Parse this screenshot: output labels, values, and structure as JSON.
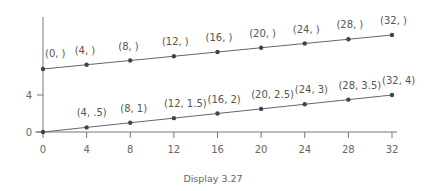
{
  "caption": "Display 3.27",
  "chart_data": {
    "type": "line",
    "title": "",
    "caption": "Display 3.27",
    "xlabel": "",
    "ylabel": "",
    "x_ticks": [
      0,
      4,
      8,
      12,
      16,
      20,
      24,
      28,
      32
    ],
    "y_ticks": [
      0,
      4
    ],
    "xlim": [
      0,
      32
    ],
    "grid": false,
    "legend": null,
    "series": [
      {
        "name": "upper line (y-values blank)",
        "x": [
          0,
          4,
          8,
          12,
          16,
          20,
          24,
          28,
          32
        ],
        "point_labels": [
          "(0, )",
          "(4, )",
          "(8, )",
          "(12, )",
          "(16, )",
          "(20, )",
          "(24, )",
          "(28, )",
          "(32, )"
        ]
      },
      {
        "name": "lower line",
        "x": [
          0,
          4,
          8,
          12,
          16,
          20,
          24,
          28,
          32
        ],
        "y": [
          0,
          0.5,
          1,
          1.5,
          2,
          2.5,
          3,
          3.5,
          4
        ],
        "point_labels": [
          "",
          "(4, .5)",
          "(8, 1)",
          "(12, 1.5)",
          "(16, 2)",
          "(20, 2.5)",
          "(24, 3)",
          "(28, 3.5)",
          "(32, 4)"
        ]
      }
    ]
  }
}
